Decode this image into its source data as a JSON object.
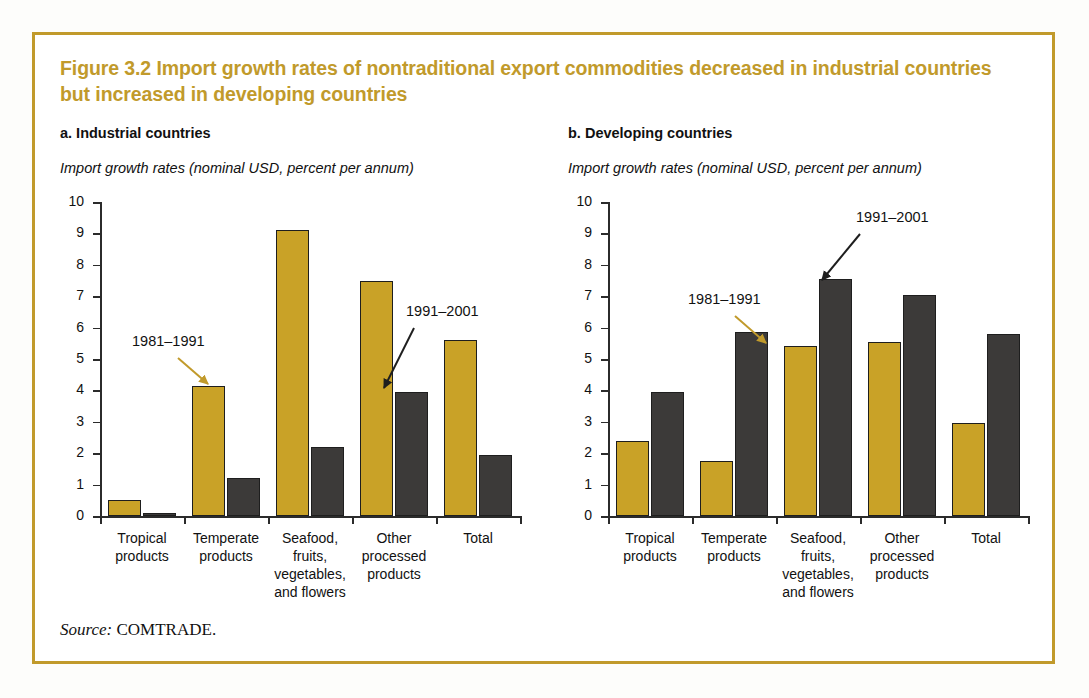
{
  "figure": {
    "title": "Figure 3.2  Import growth rates of nontraditional export commodities decreased in industrial countries but increased in developing countries",
    "source_label": "Source:",
    "source_value": "COMTRADE.",
    "accent_color": "#c19a2b",
    "series_colors": {
      "1981-1991": "#c9a227",
      "1991-2001": "#3c3a39"
    }
  },
  "chart_data": [
    {
      "type": "bar",
      "panel": "a",
      "title": "a. Industrial countries",
      "subtitle": "Import growth rates (nominal USD, percent per annum)",
      "xlabel": "",
      "ylabel": "Import growth rates (nominal USD, percent per annum)",
      "ylim": [
        0,
        10
      ],
      "yticks": [
        0,
        1,
        2,
        3,
        4,
        5,
        6,
        7,
        8,
        9,
        10
      ],
      "grid": false,
      "legend": "annotations",
      "categories": [
        "Tropical products",
        "Temperate products",
        "Seafood, fruits, vegetables, and flowers",
        "Other processed products",
        "Total"
      ],
      "category_lines": [
        [
          "Tropical",
          "products"
        ],
        [
          "Temperate",
          "products"
        ],
        [
          "Seafood,",
          "fruits,",
          "vegetables,",
          "and flowers"
        ],
        [
          "Other",
          "processed",
          "products"
        ],
        [
          "Total"
        ]
      ],
      "series": [
        {
          "name": "1981-1991",
          "label": "1981–1991",
          "color": "#c9a227",
          "values": [
            0.5,
            4.15,
            9.1,
            7.5,
            5.6
          ]
        },
        {
          "name": "1991-2001",
          "label": "1991–2001",
          "color": "#3c3a39",
          "values": [
            0.1,
            1.2,
            2.2,
            3.95,
            1.95
          ]
        }
      ],
      "annotations": [
        {
          "text": "1981–1991",
          "arrow_color": "#c19a2b",
          "points_to": "Temperate products / 1981-1991"
        },
        {
          "text": "1991–2001",
          "arrow_color": "#1e1e1e",
          "points_to": "Other processed products / 1991-2001"
        }
      ]
    },
    {
      "type": "bar",
      "panel": "b",
      "title": "b. Developing countries",
      "subtitle": "Import growth rates (nominal USD, percent per annum)",
      "xlabel": "",
      "ylabel": "Import growth rates (nominal USD, percent per annum)",
      "ylim": [
        0,
        10
      ],
      "yticks": [
        0,
        1,
        2,
        3,
        4,
        5,
        6,
        7,
        8,
        9,
        10
      ],
      "grid": false,
      "legend": "annotations",
      "categories": [
        "Tropical products",
        "Temperate products",
        "Seafood, fruits, vegetables, and flowers",
        "Other processed products",
        "Total"
      ],
      "category_lines": [
        [
          "Tropical",
          "products"
        ],
        [
          "Temperate",
          "products"
        ],
        [
          "Seafood,",
          "fruits,",
          "vegetables,",
          "and flowers"
        ],
        [
          "Other",
          "processed",
          "products"
        ],
        [
          "Total"
        ]
      ],
      "series": [
        {
          "name": "1981-1991",
          "label": "1981–1991",
          "color": "#c9a227",
          "values": [
            2.4,
            1.75,
            5.4,
            5.55,
            2.95
          ]
        },
        {
          "name": "1991-2001",
          "label": "1991–2001",
          "color": "#3c3a39",
          "values": [
            3.95,
            5.85,
            7.55,
            7.05,
            5.8
          ]
        }
      ],
      "annotations": [
        {
          "text": "1981–1991",
          "arrow_color": "#c19a2b",
          "points_to": "Seafood / 1981-1991"
        },
        {
          "text": "1991–2001",
          "arrow_color": "#1e1e1e",
          "points_to": "Seafood / 1991-2001"
        }
      ]
    }
  ]
}
